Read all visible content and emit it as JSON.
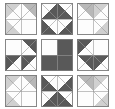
{
  "figure": {
    "kind": "quilt-block-layout",
    "canvas_width": 115,
    "canvas_height": 109,
    "background": "#ffffff"
  },
  "palette": {
    "white": "#fdfdfd",
    "light_gray": "#d0d0d0",
    "medium_gray": "#b8b8b8",
    "dark_gray": "#595959",
    "outline": "#7a7a7a",
    "seam_line": "#9a9a9a"
  },
  "layout": {
    "rows": 3,
    "cols": 3,
    "block_size": 32,
    "gap": 4,
    "origin_x": 5,
    "origin_y": 3,
    "row_tops": [
      3,
      39,
      75
    ],
    "col_lefts": [
      5,
      41,
      77
    ],
    "bottom_row_clipped": true
  },
  "chart_data": {
    "type": "heatmap",
    "xlabel": "",
    "ylabel": "",
    "grid": true,
    "legend_position": "none",
    "categories": [
      "col-1",
      "col-2",
      "col-3"
    ],
    "row_labels": [
      "row-1",
      "row-2",
      "row-3"
    ],
    "series": [
      {
        "name": "row-1",
        "values": [
          1,
          2,
          3
        ]
      },
      {
        "name": "row-2",
        "values": [
          4,
          5,
          6
        ]
      },
      {
        "name": "row-3",
        "values": [
          7,
          8,
          9
        ]
      }
    ]
  },
  "blocks": [
    {
      "id": "block-r1c1",
      "position": "top-left",
      "name": "corner-star-point-block",
      "units": [
        {
          "unit": "top-left",
          "style": "hst-diag-tlbr",
          "fill_a": "light_gray",
          "fill_b": "white"
        },
        {
          "unit": "top-right",
          "style": "hst-diag-trbl",
          "fill_a": "white",
          "fill_b": "medium_gray"
        },
        {
          "unit": "bottom-left",
          "style": "hst-diag-trbl",
          "fill_a": "light_gray",
          "fill_b": "white"
        },
        {
          "unit": "bottom-right",
          "style": "solid",
          "fill_a": "white",
          "fill_b": "white"
        }
      ]
    },
    {
      "id": "block-r1c2",
      "position": "top-center",
      "name": "star-point-down-block",
      "units": [
        {
          "unit": "top-left",
          "style": "flying-geese-right",
          "fill_a": "white",
          "fill_b": "dark_gray"
        },
        {
          "unit": "top-right",
          "style": "flying-geese-left",
          "fill_a": "white",
          "fill_b": "dark_gray"
        },
        {
          "unit": "bottom-left",
          "style": "hst-diag-trbl",
          "fill_a": "dark_gray",
          "fill_b": "white"
        },
        {
          "unit": "bottom-right",
          "style": "hst-diag-tlbr",
          "fill_a": "white",
          "fill_b": "dark_gray"
        }
      ]
    },
    {
      "id": "block-r1c3",
      "position": "top-right",
      "name": "corner-star-point-block-mirrored",
      "units": [
        {
          "unit": "top-left",
          "style": "hst-diag-trbl",
          "fill_a": "white",
          "fill_b": "medium_gray"
        },
        {
          "unit": "top-right",
          "style": "hst-diag-tlbr",
          "fill_a": "light_gray",
          "fill_b": "white"
        },
        {
          "unit": "bottom-left",
          "style": "solid",
          "fill_a": "white",
          "fill_b": "white"
        },
        {
          "unit": "bottom-right",
          "style": "hst-diag-tlbr",
          "fill_a": "white",
          "fill_b": "light_gray"
        }
      ]
    },
    {
      "id": "block-r2c1",
      "position": "middle-left",
      "name": "star-point-left-block",
      "units": [
        {
          "unit": "top-left",
          "style": "solid",
          "fill_a": "white",
          "fill_b": "white"
        },
        {
          "unit": "top-right",
          "style": "hst-diag-trbl",
          "fill_a": "white",
          "fill_b": "dark_gray"
        },
        {
          "unit": "bottom-left",
          "style": "flying-geese-down",
          "fill_a": "white",
          "fill_b": "dark_gray"
        },
        {
          "unit": "bottom-right",
          "style": "hst-diag-tlbr",
          "fill_a": "dark_gray",
          "fill_b": "white"
        }
      ]
    },
    {
      "id": "block-r2c2",
      "position": "center",
      "name": "center-cross-block",
      "units": [
        {
          "unit": "top-left",
          "style": "solid",
          "fill_a": "white",
          "fill_b": "white"
        },
        {
          "unit": "top-right",
          "style": "solid",
          "fill_a": "dark_gray",
          "fill_b": "dark_gray"
        },
        {
          "unit": "bottom-left",
          "style": "solid",
          "fill_a": "dark_gray",
          "fill_b": "dark_gray"
        },
        {
          "unit": "bottom-right",
          "style": "solid",
          "fill_a": "dark_gray",
          "fill_b": "dark_gray"
        }
      ]
    },
    {
      "id": "block-r2c3",
      "position": "middle-right",
      "name": "star-point-right-block",
      "units": [
        {
          "unit": "top-left",
          "style": "hst-diag-tlbr",
          "fill_a": "dark_gray",
          "fill_b": "white"
        },
        {
          "unit": "top-right",
          "style": "solid",
          "fill_a": "white",
          "fill_b": "white"
        },
        {
          "unit": "bottom-left",
          "style": "hst-diag-trbl",
          "fill_a": "white",
          "fill_b": "dark_gray"
        },
        {
          "unit": "bottom-right",
          "style": "flying-geese-down",
          "fill_a": "white",
          "fill_b": "dark_gray"
        }
      ]
    },
    {
      "id": "block-r3c1",
      "position": "bottom-left",
      "name": "corner-star-point-block-lower",
      "units": [
        {
          "unit": "top-left",
          "style": "hst-diag-tlbr",
          "fill_a": "light_gray",
          "fill_b": "white"
        },
        {
          "unit": "top-right",
          "style": "hst-diag-trbl",
          "fill_a": "white",
          "fill_b": "medium_gray"
        },
        {
          "unit": "bottom-left",
          "style": "hst-diag-trbl",
          "fill_a": "light_gray",
          "fill_b": "white"
        },
        {
          "unit": "bottom-right",
          "style": "solid",
          "fill_a": "white",
          "fill_b": "white"
        }
      ]
    },
    {
      "id": "block-r3c2",
      "position": "bottom-center",
      "name": "star-point-up-block",
      "units": [
        {
          "unit": "top-left",
          "style": "hst-diag-trbl",
          "fill_a": "dark_gray",
          "fill_b": "white"
        },
        {
          "unit": "top-right",
          "style": "hst-diag-tlbr",
          "fill_a": "white",
          "fill_b": "dark_gray"
        },
        {
          "unit": "bottom-left",
          "style": "flying-geese-right",
          "fill_a": "white",
          "fill_b": "dark_gray"
        },
        {
          "unit": "bottom-right",
          "style": "flying-geese-left",
          "fill_a": "white",
          "fill_b": "dark_gray"
        }
      ]
    },
    {
      "id": "block-r3c3",
      "position": "bottom-right",
      "name": "corner-star-point-block-lower-mirrored",
      "units": [
        {
          "unit": "top-left",
          "style": "hst-diag-trbl",
          "fill_a": "white",
          "fill_b": "medium_gray"
        },
        {
          "unit": "top-right",
          "style": "hst-diag-tlbr",
          "fill_a": "light_gray",
          "fill_b": "white"
        },
        {
          "unit": "bottom-left",
          "style": "solid",
          "fill_a": "white",
          "fill_b": "white"
        },
        {
          "unit": "bottom-right",
          "style": "hst-diag-tlbr",
          "fill_a": "white",
          "fill_b": "light_gray"
        }
      ]
    }
  ]
}
